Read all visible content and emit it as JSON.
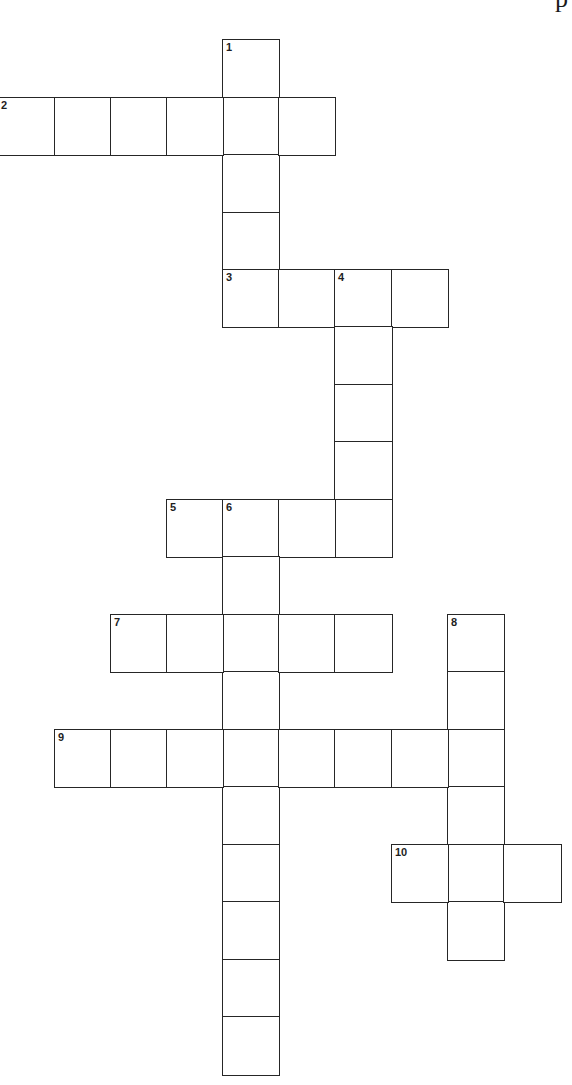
{
  "page": {
    "header_fragment": "p",
    "line_color": "#262626",
    "background": "#ffffff"
  },
  "grid_geometry": {
    "col_x": [
      -3,
      54,
      110,
      166,
      222,
      278,
      334,
      391,
      447,
      503
    ],
    "row_y": [
      39,
      97,
      154,
      212,
      269,
      326,
      384,
      441,
      499,
      556,
      614,
      671,
      729,
      786,
      844,
      901,
      959,
      1016
    ],
    "cell_size": 57
  },
  "words": [
    {
      "number": "1",
      "direction": "down",
      "row": 0,
      "col": 4,
      "length": 5
    },
    {
      "number": "2",
      "direction": "across",
      "row": 1,
      "col": 0,
      "length": 6
    },
    {
      "number": "3",
      "direction": "across",
      "row": 4,
      "col": 4,
      "length": 4
    },
    {
      "number": "4",
      "direction": "down",
      "row": 4,
      "col": 6,
      "length": 5
    },
    {
      "number": "5",
      "direction": "across",
      "row": 8,
      "col": 3,
      "length": 4
    },
    {
      "number": "6",
      "direction": "down",
      "row": 8,
      "col": 4,
      "length": 10
    },
    {
      "number": "7",
      "direction": "across",
      "row": 10,
      "col": 2,
      "length": 5
    },
    {
      "number": "8",
      "direction": "down",
      "row": 10,
      "col": 8,
      "length": 6
    },
    {
      "number": "9",
      "direction": "across",
      "row": 12,
      "col": 1,
      "length": 8
    },
    {
      "number": "10",
      "direction": "across",
      "row": 14,
      "col": 7,
      "length": 3
    }
  ]
}
